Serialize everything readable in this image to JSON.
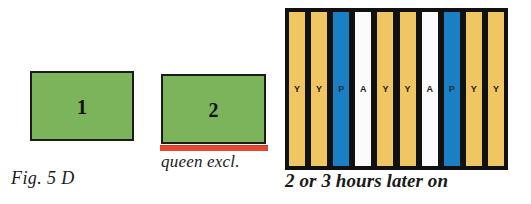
{
  "figure": {
    "caption": "Fig. 5 D",
    "later_caption": "2 or 3 hours later on",
    "queen_excluder_label": "queen excl."
  },
  "colors": {
    "green_box": "#7CB45C",
    "red_excluder": "#E8452F",
    "frame_yellow": "#EFC662",
    "frame_blue": "#1B7FC4",
    "frame_white": "#FBFBFB",
    "outline": "#111111"
  },
  "hive_boxes": [
    {
      "number": "1"
    },
    {
      "number": "2"
    }
  ],
  "frame_panel": {
    "frames": [
      {
        "letter": "Y",
        "color": "yellow"
      },
      {
        "letter": "Y",
        "color": "yellow"
      },
      {
        "letter": "P",
        "color": "blue"
      },
      {
        "letter": "A",
        "color": "white"
      },
      {
        "letter": "Y",
        "color": "yellow"
      },
      {
        "letter": "Y",
        "color": "yellow"
      },
      {
        "letter": "A",
        "color": "white"
      },
      {
        "letter": "P",
        "color": "blue"
      },
      {
        "letter": "Y",
        "color": "yellow"
      },
      {
        "letter": "Y",
        "color": "yellow"
      }
    ]
  }
}
